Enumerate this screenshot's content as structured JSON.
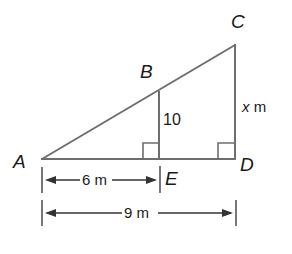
{
  "figure": {
    "kind": "geometry-diagram",
    "stroke_color": "#6e6e6e",
    "text_color": "#1a1a1a",
    "background": "#ffffff",
    "vertices": [
      {
        "name": "A",
        "label": "A",
        "x": 42,
        "y": 159,
        "label_x": 13,
        "label_y": 152
      },
      {
        "name": "B",
        "label": "B",
        "x": 159,
        "y": 92,
        "label_x": 140,
        "label_y": 62
      },
      {
        "name": "C",
        "label": "C",
        "x": 235,
        "y": 45,
        "label_x": 231,
        "label_y": 12
      },
      {
        "name": "D",
        "label": "D",
        "x": 235,
        "y": 159,
        "label_x": 240,
        "label_y": 155
      },
      {
        "name": "E",
        "label": "E",
        "x": 159,
        "y": 159,
        "label_x": 165,
        "label_y": 169
      }
    ],
    "segments": [
      {
        "name": "hypotenuse-AC",
        "x1": 42,
        "y1": 159,
        "x2": 235,
        "y2": 45
      },
      {
        "name": "base-AD",
        "x1": 42,
        "y1": 159,
        "x2": 235,
        "y2": 159
      },
      {
        "name": "side-CD",
        "x1": 235,
        "y1": 45,
        "x2": 235,
        "y2": 159
      },
      {
        "name": "segment-BE",
        "x1": 159,
        "y1": 92,
        "x2": 159,
        "y2": 159
      }
    ],
    "right_angles": [
      {
        "name": "right-angle-at-E",
        "x": 143,
        "y": 143,
        "size": 16
      },
      {
        "name": "right-angle-at-D",
        "x": 218,
        "y": 143,
        "size": 16
      }
    ],
    "measure_labels": {
      "be_length": "10",
      "be_length_x": 163,
      "be_length_y": 112,
      "cd_length_var": "x",
      "cd_length_unit": "m",
      "cd_length_x": 242,
      "cd_length_y": 99
    },
    "dimensions": [
      {
        "name": "dimension-6m",
        "label": "6 m",
        "x1": 42,
        "x2": 159,
        "y": 180,
        "tick_top": 167,
        "tick_bottom": 193,
        "label_x": 82,
        "label_y": 172
      },
      {
        "name": "dimension-9m",
        "label": "9 m",
        "x1": 42,
        "x2": 236,
        "y": 213,
        "tick_top": 200,
        "tick_bottom": 226,
        "label_x": 124,
        "label_y": 205
      }
    ]
  }
}
